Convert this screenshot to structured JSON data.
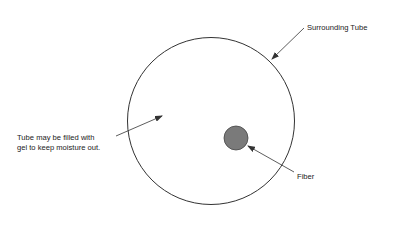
{
  "diagram": {
    "labels": {
      "surrounding_tube": "Surrounding Tube",
      "gel_line1": "Tube may be filled with",
      "gel_line2": "gel to keep moisture out.",
      "fiber": "Fiber"
    },
    "colors": {
      "stroke": "#333333",
      "fiber_fill": "#7a7a7a",
      "background": "#ffffff"
    }
  }
}
